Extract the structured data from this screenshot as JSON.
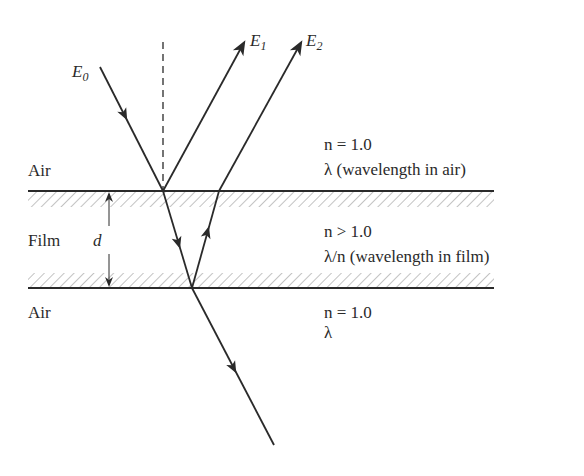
{
  "diagram": {
    "colors": {
      "line": "#2a2a2a",
      "hatch": "#9a9a9a",
      "background": "#ffffff"
    },
    "rays": {
      "incident": {
        "label": "E",
        "subscript": "0"
      },
      "reflected_top": {
        "label": "E",
        "subscript": "1"
      },
      "reflected_bottom": {
        "label": "E",
        "subscript": "2"
      }
    },
    "regions": {
      "top": {
        "name": "Air",
        "index": "n = 1.0",
        "wavelength": "λ (wavelength in air)"
      },
      "film": {
        "name": "Film",
        "index": "n > 1.0",
        "wavelength": "λ/n (wavelength in film)",
        "thickness_label": "d"
      },
      "bottom": {
        "name": "Air",
        "index": "n = 1.0",
        "wavelength": "λ"
      }
    }
  }
}
